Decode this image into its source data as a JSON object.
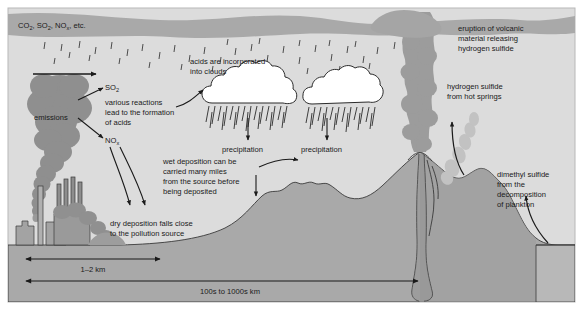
{
  "figure": {
    "title_text": "Acid deposition and natural sulfur emissions diagram",
    "panel_bg": "#dcdcdc",
    "page_bg": "#ffffff",
    "border_color": "#b4b4b4",
    "ink": "#1a1a1a"
  },
  "labels": {
    "gases": {
      "part1": "CO",
      "sub1": "2",
      "part2": ", SO",
      "sub2": "2",
      "part3": ", NO",
      "sub3": "x",
      "part4": ", etc."
    },
    "emissions": "emissions",
    "so2": {
      "base": "SO",
      "sub": "2"
    },
    "nox": {
      "base": "NO",
      "sub": "x"
    },
    "various_reactions": [
      "various reactions",
      "lead to the formation",
      "of acids"
    ],
    "acids_clouds": [
      "acids are incorporated",
      "into clouds"
    ],
    "precipitation_left": "precipitation",
    "precipitation_right": "precipitation",
    "wet_deposition": [
      "wet deposition can be",
      "carried many miles",
      "from the source before",
      "being deposited"
    ],
    "dry_deposition": [
      "dry deposition falls close",
      "to the pollution source"
    ],
    "eruption": [
      "eruption of volcanic",
      "material releasing",
      "hydrogen sulfide"
    ],
    "hot_springs": [
      "hydrogen sulfide",
      "from hot springs"
    ],
    "dimethyl_sulfide": [
      "dimethyl sulfide",
      "from the",
      "decomposition",
      "of plankton"
    ],
    "scale_near": "1–2 km",
    "scale_far": "100s to 1000s km"
  },
  "colors": {
    "sky": "#dcdcdc",
    "atmosphere_band": "#a8a8a8",
    "smoke_plume": "#8f8f8f",
    "terrain": "#a8a8a8",
    "terrain_dark": "#9a9a9a",
    "factory": "#a0a0a0",
    "cloud_fill": "#ffffff",
    "cloud_stroke": "#2b2b2b",
    "volcano_plume": "#9b9b9b",
    "hot_spring_steam": "#bdbdbd",
    "ocean": "#b5b5b5",
    "line": "#1a1a1a"
  }
}
